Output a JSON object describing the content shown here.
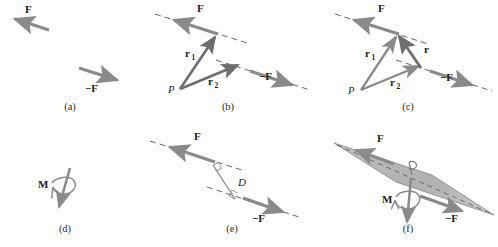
{
  "figure": {
    "width": 498,
    "height": 247,
    "background": "#ffffff"
  },
  "colors": {
    "arrow_gray": "#8a8a8a",
    "arrow_dark": "#6e6e6e",
    "line_dash": "#555555",
    "plane_fill": "#b5b5b5",
    "plane_stroke": "#7a7a7a",
    "text": "#1a1a1a",
    "caption": "#2a2a2a"
  },
  "labels": {
    "force": "F",
    "force_negative": "−F",
    "moment": "M",
    "r": "r",
    "r1": "r",
    "r1_sub": "1",
    "r2": "r",
    "r2_sub": "2",
    "point_p": "P",
    "distance": "D"
  },
  "panels": [
    {
      "id": "a",
      "caption": "(a)",
      "caption_x": 70,
      "caption_y": 110,
      "description": "Two equal and opposite forces F and -F",
      "elements": [
        "force-arrow-f",
        "force-arrow-negative-f"
      ]
    },
    {
      "id": "b",
      "caption": "(b)",
      "caption_x": 228,
      "caption_y": 110,
      "description": "Position vectors r1 and r2 from point P to the lines of action",
      "elements": [
        "force-arrow-f",
        "force-arrow-negative-f",
        "line-of-action-f",
        "line-of-action-negative-f",
        "vector-r1",
        "vector-r2",
        "point-p"
      ]
    },
    {
      "id": "c",
      "caption": "(c)",
      "caption_x": 408,
      "caption_y": 110,
      "description": "Vector r equals r1 minus r2 connecting the two lines of action",
      "elements": [
        "force-arrow-f",
        "force-arrow-negative-f",
        "line-of-action-f",
        "line-of-action-negative-f",
        "vector-r1",
        "vector-r2",
        "vector-r",
        "point-p"
      ]
    },
    {
      "id": "d",
      "caption": "(d)",
      "caption_x": 65,
      "caption_y": 232,
      "description": "Moment vector M with curved rotation arrow",
      "elements": [
        "moment-vector",
        "rotation-arc"
      ]
    },
    {
      "id": "e",
      "caption": "(e)",
      "caption_x": 232,
      "caption_y": 232,
      "description": "Perpendicular distance D between the two lines of action",
      "elements": [
        "force-arrow-f",
        "force-arrow-negative-f",
        "line-of-action-f",
        "line-of-action-negative-f",
        "distance-segment",
        "right-angle-marker-top",
        "right-angle-marker-bottom"
      ]
    },
    {
      "id": "f",
      "caption": "(f)",
      "caption_x": 408,
      "caption_y": 232,
      "description": "Plane containing the couple with normal moment vector M",
      "elements": [
        "couple-plane",
        "force-arrow-f",
        "force-arrow-negative-f",
        "moment-vector",
        "rotation-arc",
        "normal-marker"
      ]
    }
  ]
}
